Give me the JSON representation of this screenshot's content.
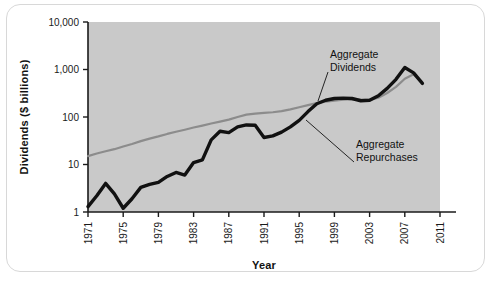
{
  "chart_data": {
    "type": "line",
    "title": "",
    "xlabel": "Year",
    "ylabel": "Dividends ($ billions)",
    "yscale": "log",
    "ylim": [
      1,
      10000
    ],
    "xlim": [
      1971,
      2011
    ],
    "grid": false,
    "legend_position": "inline-annotations",
    "plot_background": "#c9c9c9",
    "ytick_labels": [
      "10,000",
      "1,000",
      "100",
      "10",
      "1"
    ],
    "ytick_values": [
      10000,
      1000,
      100,
      10,
      1
    ],
    "xtick_labels": [
      "1971",
      "1975",
      "1979",
      "1983",
      "1987",
      "1991",
      "1995",
      "1999",
      "2003",
      "2007",
      "2011"
    ],
    "xtick_values": [
      1971,
      1975,
      1979,
      1983,
      1987,
      1991,
      1995,
      1999,
      2003,
      2007,
      2011
    ],
    "x": [
      1971,
      1972,
      1973,
      1974,
      1975,
      1976,
      1977,
      1978,
      1979,
      1980,
      1981,
      1982,
      1983,
      1984,
      1985,
      1986,
      1987,
      1988,
      1989,
      1990,
      1991,
      1992,
      1993,
      1994,
      1995,
      1996,
      1997,
      1998,
      1999,
      2000,
      2001,
      2002,
      2003,
      2004,
      2005,
      2006,
      2007,
      2008,
      2009
    ],
    "series": [
      {
        "name": "Aggregate Dividends",
        "color": "#8c8c8c",
        "linewidth": 2.2,
        "values": [
          15,
          17,
          19,
          21,
          24,
          27,
          31,
          35,
          39,
          44,
          49,
          54,
          60,
          66,
          73,
          80,
          88,
          100,
          112,
          118,
          122,
          126,
          133,
          145,
          160,
          178,
          196,
          210,
          222,
          232,
          238,
          232,
          230,
          255,
          320,
          430,
          640,
          790,
          520
        ]
      },
      {
        "name": "Aggregate Repurchases",
        "color": "#111111",
        "linewidth": 3.4,
        "values": [
          1.3,
          2.2,
          4.0,
          2.4,
          1.2,
          1.9,
          3.3,
          3.8,
          4.2,
          5.6,
          6.8,
          6.0,
          11.0,
          12.5,
          33,
          50,
          47,
          62,
          68,
          67,
          37,
          40,
          48,
          62,
          85,
          130,
          190,
          225,
          245,
          250,
          245,
          220,
          225,
          280,
          400,
          620,
          1100,
          850,
          510
        ]
      }
    ],
    "annotations": [
      {
        "text_line1": "Aggregate",
        "text_line2": "Dividends",
        "target_series": "Aggregate Dividends",
        "target_year": 1996
      },
      {
        "text_line1": "Aggregate",
        "text_line2": "Repurchases",
        "target_series": "Aggregate Repurchases",
        "target_year": 1997
      }
    ]
  }
}
